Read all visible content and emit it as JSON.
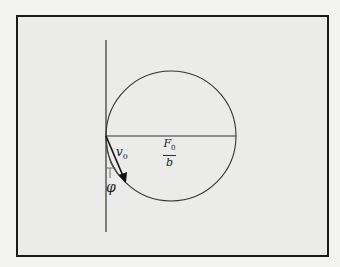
{
  "figure": {
    "labels": {
      "velocity_symbol": "v",
      "velocity_subscript": "0",
      "force_numerator_symbol": "F",
      "force_numerator_subscript": "0",
      "force_denominator": "b",
      "angle": "φ"
    },
    "colors": {
      "background": "#f4f4f2",
      "panel": "#ebebe9",
      "ink": "#222222",
      "frame": "#1a1a1a"
    },
    "geometry": {
      "vertical_axis": {
        "x": 106,
        "y1": 40,
        "y2": 232
      },
      "circle": {
        "cx": 171,
        "cy": 136,
        "r": 65
      },
      "diameter": {
        "x1": 106,
        "x2": 236,
        "y": 136
      },
      "velocity_arrow": {
        "x1": 106,
        "y1": 136,
        "x2": 126,
        "y2": 182
      }
    }
  }
}
